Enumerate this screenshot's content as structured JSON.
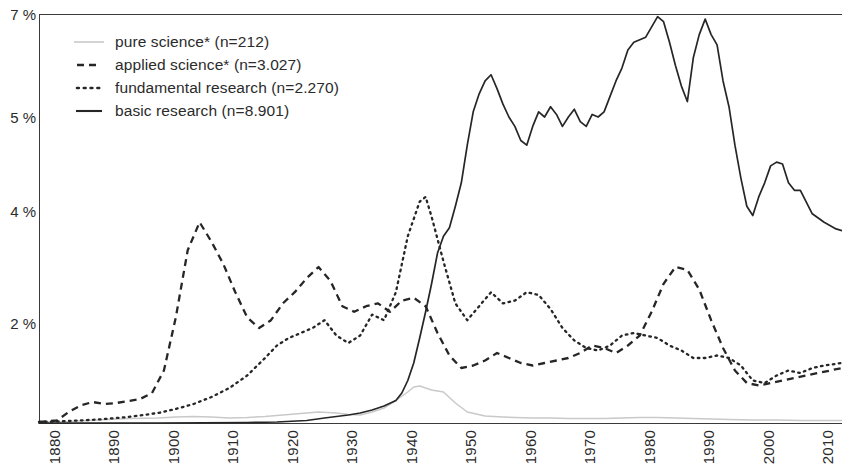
{
  "chart_data": {
    "type": "line",
    "title": "",
    "subtitle": "",
    "xlabel": "",
    "ylabel": "",
    "xlim": [
      1880,
      2015
    ],
    "ylim": [
      0,
      7
    ],
    "grid": false,
    "legend_position": "top-left",
    "y_ticks": [
      {
        "label": "7 %",
        "value": 7
      },
      {
        "label": "5 %",
        "value": 5
      },
      {
        "label": "4 %",
        "value": 4
      },
      {
        "label": "2 %",
        "value": 2
      }
    ],
    "x_ticks": [
      {
        "label": "1880",
        "value": 1880
      },
      {
        "label": "1890",
        "value": 1890
      },
      {
        "label": "1900",
        "value": 1900
      },
      {
        "label": "1910",
        "value": 1910
      },
      {
        "label": "1920",
        "value": 1920
      },
      {
        "label": "1930",
        "value": 1930
      },
      {
        "label": "1940",
        "value": 1940
      },
      {
        "label": "1950",
        "value": 1950
      },
      {
        "label": "1960",
        "value": 1960
      },
      {
        "label": "1970",
        "value": 1970
      },
      {
        "label": "1980",
        "value": 1980
      },
      {
        "label": "1990",
        "value": 1990
      },
      {
        "label": "2000",
        "value": 2000
      },
      {
        "label": "2010",
        "value": 2010
      }
    ],
    "series": [
      {
        "name": "pure science* (n=212)",
        "short": "pure science*",
        "n": "212",
        "style": "thin-solid-gray",
        "color": "#c9c9c9",
        "x": [
          1880,
          1885,
          1890,
          1895,
          1900,
          1903,
          1906,
          1909,
          1912,
          1915,
          1918,
          1921,
          1924,
          1927,
          1930,
          1932,
          1934,
          1936,
          1938,
          1940,
          1942,
          1943,
          1944,
          1945,
          1946,
          1947,
          1948,
          1950,
          1952,
          1955,
          1958,
          1960,
          1963,
          1966,
          1969,
          1972,
          1975,
          1978,
          1981,
          1984,
          1987,
          1990,
          1993,
          1996,
          2000,
          2004,
          2008,
          2012,
          2015
        ],
        "y": [
          0.02,
          0.03,
          0.06,
          0.09,
          0.1,
          0.12,
          0.13,
          0.12,
          0.1,
          0.11,
          0.13,
          0.16,
          0.19,
          0.22,
          0.2,
          0.17,
          0.16,
          0.22,
          0.3,
          0.45,
          0.62,
          0.72,
          0.74,
          0.7,
          0.66,
          0.64,
          0.62,
          0.4,
          0.22,
          0.14,
          0.12,
          0.11,
          0.1,
          0.1,
          0.09,
          0.09,
          0.09,
          0.1,
          0.11,
          0.11,
          0.1,
          0.09,
          0.08,
          0.07,
          0.06,
          0.06,
          0.05,
          0.05,
          0.05
        ]
      },
      {
        "name": "applied science* (n=3.027)",
        "short": "applied science*",
        "n": "3.027",
        "style": "dashed",
        "color": "#262626",
        "x": [
          1880,
          1883,
          1885,
          1887,
          1889,
          1891,
          1893,
          1895,
          1897,
          1899,
          1901,
          1903,
          1905,
          1907,
          1909,
          1911,
          1913,
          1915,
          1917,
          1919,
          1921,
          1923,
          1925,
          1927,
          1929,
          1931,
          1933,
          1935,
          1937,
          1939,
          1941,
          1943,
          1945,
          1947,
          1949,
          1951,
          1953,
          1955,
          1957,
          1959,
          1961,
          1963,
          1965,
          1967,
          1969,
          1971,
          1973,
          1975,
          1977,
          1979,
          1981,
          1983,
          1985,
          1987,
          1989,
          1991,
          1993,
          1995,
          1997,
          1999,
          2001,
          2003,
          2005,
          2007,
          2009,
          2011,
          2013,
          2015
        ],
        "y": [
          0.02,
          0.05,
          0.22,
          0.35,
          0.42,
          0.38,
          0.4,
          0.44,
          0.48,
          0.6,
          1.05,
          2.1,
          3.3,
          3.8,
          3.45,
          3.05,
          2.55,
          2.1,
          1.9,
          2.05,
          2.35,
          2.55,
          2.8,
          3.0,
          2.75,
          2.3,
          2.2,
          2.3,
          2.35,
          2.2,
          2.4,
          2.45,
          2.3,
          1.8,
          1.35,
          1.1,
          1.15,
          1.25,
          1.4,
          1.3,
          1.2,
          1.15,
          1.2,
          1.25,
          1.3,
          1.4,
          1.55,
          1.5,
          1.4,
          1.55,
          1.75,
          2.2,
          2.7,
          3.0,
          2.95,
          2.6,
          2.05,
          1.5,
          1.05,
          0.8,
          0.75,
          0.8,
          0.85,
          0.9,
          0.95,
          1.0,
          1.05,
          1.1
        ]
      },
      {
        "name": "fundamental research (n=2.270)",
        "short": "fundamental research",
        "n": "2.270",
        "style": "dotted",
        "color": "#262626",
        "x": [
          1880,
          1885,
          1890,
          1895,
          1900,
          1903,
          1906,
          1909,
          1912,
          1915,
          1918,
          1920,
          1922,
          1924,
          1926,
          1928,
          1930,
          1932,
          1934,
          1936,
          1938,
          1940,
          1942,
          1944,
          1945,
          1946,
          1948,
          1950,
          1952,
          1954,
          1956,
          1958,
          1960,
          1962,
          1964,
          1966,
          1968,
          1970,
          1972,
          1974,
          1976,
          1978,
          1980,
          1982,
          1984,
          1986,
          1988,
          1990,
          1992,
          1994,
          1996,
          1998,
          2000,
          2002,
          2004,
          2006,
          2008,
          2010,
          2012,
          2015
        ],
        "y": [
          0.02,
          0.04,
          0.07,
          0.12,
          0.2,
          0.28,
          0.38,
          0.52,
          0.7,
          0.95,
          1.3,
          1.55,
          1.7,
          1.8,
          1.9,
          2.05,
          1.75,
          1.6,
          1.75,
          2.15,
          2.05,
          2.55,
          3.55,
          4.1,
          4.15,
          3.9,
          3.1,
          2.35,
          2.05,
          2.3,
          2.55,
          2.35,
          2.4,
          2.55,
          2.5,
          2.25,
          1.9,
          1.65,
          1.5,
          1.45,
          1.55,
          1.75,
          1.8,
          1.75,
          1.7,
          1.55,
          1.45,
          1.3,
          1.3,
          1.35,
          1.3,
          1.15,
          0.85,
          0.8,
          0.95,
          1.05,
          1.0,
          1.1,
          1.15,
          1.2
        ]
      },
      {
        "name": "basic research (n=8.901)",
        "short": "basic research",
        "n": "8.901",
        "style": "solid",
        "color": "#262626",
        "x": [
          1880,
          1900,
          1915,
          1920,
          1925,
          1928,
          1930,
          1932,
          1934,
          1936,
          1938,
          1940,
          1941,
          1942,
          1943,
          1944,
          1945,
          1946,
          1947,
          1948,
          1949,
          1950,
          1951,
          1952,
          1953,
          1954,
          1955,
          1956,
          1957,
          1958,
          1959,
          1960,
          1961,
          1962,
          1963,
          1964,
          1965,
          1966,
          1967,
          1968,
          1969,
          1970,
          1971,
          1972,
          1973,
          1974,
          1975,
          1976,
          1977,
          1978,
          1979,
          1980,
          1981,
          1982,
          1983,
          1984,
          1985,
          1986,
          1987,
          1988,
          1989,
          1990,
          1991,
          1992,
          1993,
          1994,
          1995,
          1996,
          1997,
          1998,
          1999,
          2000,
          2001,
          2002,
          2003,
          2004,
          2005,
          2006,
          2007,
          2008,
          2010,
          2012,
          2014,
          2015
        ],
        "y": [
          0.0,
          0.0,
          0.01,
          0.02,
          0.05,
          0.1,
          0.13,
          0.16,
          0.2,
          0.26,
          0.34,
          0.45,
          0.6,
          0.85,
          1.2,
          1.7,
          2.2,
          2.7,
          3.25,
          3.55,
          3.7,
          4.05,
          4.3,
          4.7,
          5.1,
          5.45,
          5.7,
          5.82,
          5.55,
          5.25,
          5.0,
          4.9,
          4.75,
          4.7,
          4.9,
          5.1,
          5.0,
          5.2,
          5.05,
          4.9,
          5.0,
          5.15,
          4.95,
          4.9,
          5.05,
          5.0,
          5.1,
          5.4,
          5.7,
          5.95,
          6.3,
          6.45,
          6.5,
          6.55,
          6.75,
          6.95,
          6.85,
          6.45,
          6.0,
          5.6,
          5.3,
          6.15,
          6.6,
          6.9,
          6.6,
          6.4,
          5.7,
          5.2,
          4.7,
          4.35,
          4.05,
          3.92,
          4.15,
          4.3,
          4.48,
          4.52,
          4.5,
          4.3,
          4.22,
          4.22,
          3.95,
          3.8,
          3.68,
          3.65
        ]
      }
    ]
  },
  "legend": {
    "items": [
      {
        "label": "pure science* (n=212)",
        "marker": "thin-line-gray-icon"
      },
      {
        "label": "applied science* (n=3.027)",
        "marker": "dashed-line-icon"
      },
      {
        "label": "fundamental research (n=2.270)",
        "marker": "dotted-line-icon"
      },
      {
        "label": "basic research (n=8.901)",
        "marker": "solid-line-icon"
      }
    ]
  }
}
